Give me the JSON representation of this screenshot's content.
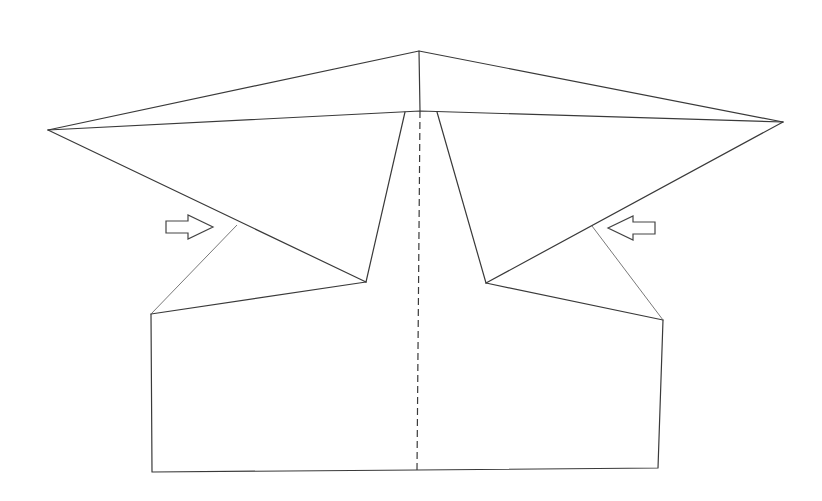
{
  "diagram": {
    "type": "paper-folding-instruction",
    "colors": {
      "line": "#3a3a3a",
      "background": "#ffffff"
    },
    "elements": {
      "outline": "paper-outline",
      "center_fold": "valley-fold-dashed-centerline",
      "left_arrow": "push-right-arrow",
      "right_arrow": "push-left-arrow"
    }
  }
}
